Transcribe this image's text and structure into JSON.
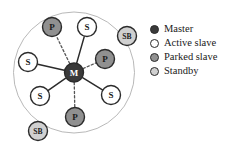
{
  "figure": {
    "type": "network-diagram",
    "piconet_circle": {
      "cx": 74,
      "cy": 72.5,
      "r": 60.5,
      "stroke": "#b0b0b0"
    },
    "colors": {
      "master_fill": "#3a3a3a",
      "active_slave_fill": "#ffffff",
      "parked_slave_fill": "#909090",
      "standby_fill": "#d0d0d0",
      "node_stroke": "#2b2b2b",
      "link_solid": "#2b2b2b",
      "link_dashed": "#555555",
      "circle_stroke": "#b0b0b0",
      "text_dark": "#1a1a1a",
      "master_label_color": "#ffffff"
    },
    "nodes": [
      {
        "id": "master",
        "label": "M",
        "role": "master",
        "x": 74,
        "y": 72.5,
        "r": 9.5
      },
      {
        "id": "slave-top",
        "label": "S",
        "role": "active-slave",
        "x": 87,
        "y": 27,
        "r": 9.5
      },
      {
        "id": "slave-left",
        "label": "S",
        "role": "active-slave",
        "x": 28,
        "y": 62,
        "r": 9.5
      },
      {
        "id": "slave-bottom-left",
        "label": "S",
        "role": "active-slave",
        "x": 40,
        "y": 96,
        "r": 9.5
      },
      {
        "id": "slave-bottom-right",
        "label": "S",
        "role": "active-slave",
        "x": 111,
        "y": 95,
        "r": 9.5
      },
      {
        "id": "parked-top",
        "label": "P",
        "role": "parked-slave",
        "x": 52,
        "y": 27,
        "r": 9.5
      },
      {
        "id": "parked-right",
        "label": "P",
        "role": "parked-slave",
        "x": 105,
        "y": 59,
        "r": 9.5
      },
      {
        "id": "parked-bottom",
        "label": "P",
        "role": "parked-slave",
        "x": 75,
        "y": 117,
        "r": 9.5
      },
      {
        "id": "standby-top-right",
        "label": "SB",
        "role": "standby",
        "x": 127,
        "y": 36,
        "r": 9.5
      },
      {
        "id": "standby-bottom-left",
        "label": "SB",
        "role": "standby",
        "x": 38,
        "y": 131,
        "r": 9.5
      }
    ],
    "links": [
      {
        "from": "master",
        "to": "slave-top",
        "style": "solid"
      },
      {
        "from": "master",
        "to": "slave-left",
        "style": "solid"
      },
      {
        "from": "master",
        "to": "slave-bottom-left",
        "style": "solid"
      },
      {
        "from": "master",
        "to": "slave-bottom-right",
        "style": "solid"
      },
      {
        "from": "master",
        "to": "parked-top",
        "style": "dashed"
      },
      {
        "from": "master",
        "to": "parked-right",
        "style": "dashed"
      },
      {
        "from": "master",
        "to": "parked-bottom",
        "style": "dashed"
      }
    ]
  },
  "legend": {
    "items": [
      {
        "label": "Master",
        "marker": "filled-dark-circle",
        "fill": "#3a3a3a",
        "stroke": "#2b2b2b"
      },
      {
        "label": "Active slave",
        "marker": "hollow-circle",
        "fill": "#ffffff",
        "stroke": "#2b2b2b"
      },
      {
        "label": "Parked slave",
        "marker": "filled-gray-circle",
        "fill": "#909090",
        "stroke": "#2b2b2b"
      },
      {
        "label": "Standby",
        "marker": "filled-light-circle",
        "fill": "#d0d0d0",
        "stroke": "#2b2b2b"
      }
    ]
  }
}
